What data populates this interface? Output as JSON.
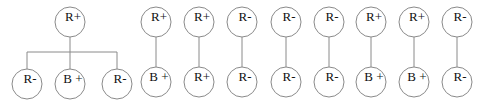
{
  "tree": {
    "root": {
      "label": "R+",
      "x": 70,
      "y": 22
    },
    "bar_y": 52,
    "children": [
      {
        "label": "R-",
        "x": 27,
        "y": 84
      },
      {
        "label": "B +",
        "x": 70,
        "y": 84
      },
      {
        "label": "R-",
        "x": 117,
        "y": 84
      }
    ]
  },
  "pairs": [
    {
      "top": "R+",
      "bottom": "B +",
      "x": 156
    },
    {
      "top": "R+",
      "bottom": "R+",
      "x": 199
    },
    {
      "top": "R-",
      "bottom": "R-",
      "x": 242
    },
    {
      "top": "R-",
      "bottom": "R-",
      "x": 286
    },
    {
      "top": "R-",
      "bottom": "R-",
      "x": 329
    },
    {
      "top": "R+",
      "bottom": "B +",
      "x": 371
    },
    {
      "top": "R+",
      "bottom": "B +",
      "x": 414
    },
    {
      "top": "R-",
      "bottom": "R-",
      "x": 457
    }
  ],
  "style": {
    "radius": 15,
    "pair_top_y": 22,
    "pair_bottom_y": 82
  }
}
